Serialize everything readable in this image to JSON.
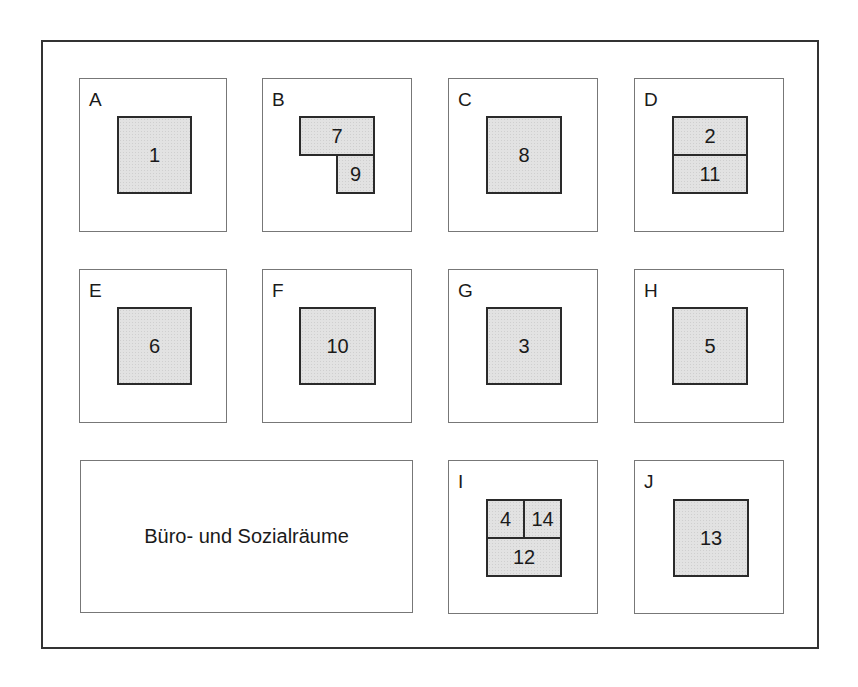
{
  "diagram": {
    "type": "floor-plan",
    "colors": {
      "room_fill": "#e2e2e2",
      "room_border": "#2a2a2a",
      "zone_border": "#777777",
      "outer_border": "#333333"
    },
    "zones": [
      {
        "label": "A",
        "rooms": [
          "1"
        ]
      },
      {
        "label": "B",
        "rooms": [
          "7",
          "9"
        ]
      },
      {
        "label": "C",
        "rooms": [
          "8"
        ]
      },
      {
        "label": "D",
        "rooms": [
          "2",
          "11"
        ]
      },
      {
        "label": "E",
        "rooms": [
          "6"
        ]
      },
      {
        "label": "F",
        "rooms": [
          "10"
        ]
      },
      {
        "label": "G",
        "rooms": [
          "3"
        ]
      },
      {
        "label": "H",
        "rooms": [
          "5"
        ]
      },
      {
        "label": "I",
        "rooms": [
          "4",
          "14",
          "12"
        ]
      },
      {
        "label": "J",
        "rooms": [
          "13"
        ]
      }
    ],
    "office_area": {
      "label": "Büro- und Sozialräume"
    }
  }
}
